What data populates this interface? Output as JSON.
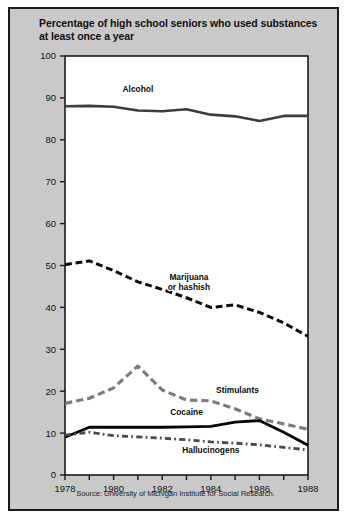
{
  "figure": {
    "title": "Percentage of high school seniors who used substances at least once a year",
    "source": "Source: University of Michigan Institute for Social Research.",
    "background_color": "#c9c9c9",
    "plot_background_color": "#ffffff",
    "border_color": "#1a1a1a"
  },
  "chart_data": {
    "type": "line",
    "title": "Percentage of high school seniors who used substances at least once a year",
    "xlabel": "",
    "ylabel": "",
    "xlim": [
      1978,
      1988
    ],
    "ylim": [
      0,
      100
    ],
    "yticks": [
      0,
      10,
      20,
      30,
      40,
      50,
      60,
      70,
      80,
      90,
      100
    ],
    "ytick_labels": [
      "0",
      "10",
      "20",
      "30",
      "40",
      "50",
      "60",
      "70",
      "80",
      "90",
      "100"
    ],
    "x": [
      1978,
      1979,
      1980,
      1981,
      1982,
      1983,
      1984,
      1985,
      1986,
      1987,
      1988
    ],
    "xticks": [
      1978,
      1979,
      1980,
      1981,
      1982,
      1983,
      1984,
      1985,
      1986,
      1987,
      1988
    ],
    "xtick_labels": [
      "1978",
      "",
      "1980",
      "",
      "1982",
      "",
      "1984",
      "",
      "1986",
      "",
      "1988"
    ],
    "xtick_labels_shown": [
      "1978",
      "1980",
      "1982",
      "1984",
      "1986",
      "1988"
    ],
    "grid": false,
    "legend_position": "inline-annotations",
    "series": [
      {
        "name": "Alcohol",
        "label": "Alcohol",
        "color": "#3d3d3d",
        "style": "solid",
        "width": 2.6,
        "values": [
          88.0,
          88.1,
          87.9,
          87.0,
          86.8,
          87.3,
          86.0,
          85.6,
          84.5,
          85.7,
          85.7
        ],
        "label_x": 1981.0,
        "label_y": 91.5
      },
      {
        "name": "Marijuana or hashish",
        "label": "Marijuana or hashish",
        "color": "#0a0a0a",
        "style": "dashed",
        "width": 3.0,
        "values": [
          50.2,
          51.1,
          48.8,
          46.1,
          44.3,
          42.3,
          40.0,
          40.6,
          38.8,
          36.3,
          33.1
        ],
        "label_x": 1983.1,
        "label_y": 46.5
      },
      {
        "name": "Stimulants",
        "label": "Stimulants",
        "color": "#7d7d7d",
        "style": "dashed",
        "width": 3.2,
        "values": [
          17.1,
          18.3,
          20.8,
          26.0,
          20.3,
          17.9,
          17.7,
          15.8,
          13.4,
          12.2,
          10.9
        ],
        "label_x": 1985.1,
        "label_y": 19.6
      },
      {
        "name": "Cocaine",
        "label": "Cocaine",
        "color": "#050505",
        "style": "solid",
        "width": 2.8,
        "values": [
          9.0,
          11.4,
          11.4,
          11.4,
          11.4,
          11.5,
          11.6,
          12.6,
          13.0,
          10.2,
          7.1
        ],
        "label_x": 1983.0,
        "label_y": 14.4
      },
      {
        "name": "Hallucinogens",
        "label": "Hallucinogens",
        "color": "#4a4a4a",
        "style": "dash-dot",
        "width": 2.8,
        "values": [
          9.5,
          10.2,
          9.4,
          9.1,
          8.8,
          8.4,
          7.9,
          7.6,
          7.2,
          6.6,
          6.0
        ],
        "label_x": 1984.0,
        "label_y": 5.2
      }
    ]
  }
}
